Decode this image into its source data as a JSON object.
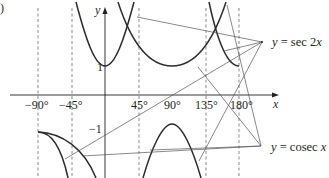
{
  "figure": {
    "part_label": ")",
    "axes": {
      "x_label": "x",
      "y_label": "y",
      "x_ticks": [
        "−90°",
        "−45°",
        "45°",
        "90°",
        "135°",
        "180°"
      ],
      "y_ticks": [
        "1",
        "−1"
      ]
    },
    "asymptotes_deg": [
      -90,
      -45,
      45,
      135,
      180
    ],
    "curves": [
      {
        "name": "sec2x",
        "label": "y = sec 2x",
        "label_prefix": "y",
        "label_eq": " = sec 2",
        "label_var": "x"
      },
      {
        "name": "cosecx",
        "label": "y = cosec x",
        "label_prefix": "y",
        "label_eq": " = cosec ",
        "label_var": "x"
      }
    ],
    "colors": {
      "ink": "#231f20",
      "curve": "#2b2b2b",
      "pointer": "#555555",
      "dash": "#6d6d6d"
    }
  }
}
